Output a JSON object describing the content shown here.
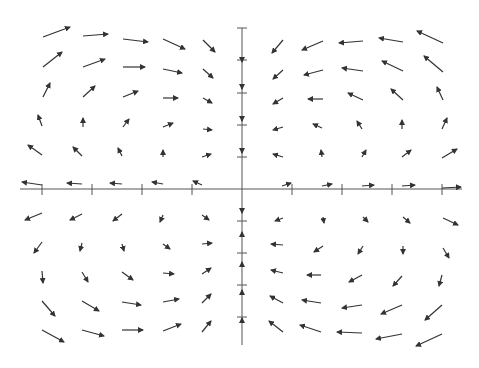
{
  "chart_data": {
    "type": "quiver",
    "title": "",
    "xlabel": "",
    "ylabel": "",
    "grid": false,
    "axes": {
      "origin_px": [
        242,
        189
      ],
      "x_axis_px": [
        20,
        462
      ],
      "y_axis_px": [
        28,
        345
      ],
      "x_ticks_px": [
        42,
        92,
        142,
        192,
        292,
        342,
        392,
        442
      ],
      "y_ticks_px": [
        28,
        60,
        93,
        125,
        157,
        221,
        253,
        285,
        317
      ],
      "tick_labels": []
    },
    "style": {
      "arrow_color": "#333333",
      "axis_color": "#555555"
    },
    "arrows": [
      [
        43,
        37,
        70,
        27
      ],
      [
        83,
        36,
        108,
        34
      ],
      [
        123,
        39,
        148,
        42
      ],
      [
        163,
        39,
        185,
        49
      ],
      [
        203,
        40,
        215,
        52
      ],
      [
        43,
        67,
        62,
        52
      ],
      [
        83,
        67,
        105,
        59
      ],
      [
        123,
        67,
        145,
        67
      ],
      [
        163,
        69,
        182,
        73
      ],
      [
        203,
        69,
        213,
        78
      ],
      [
        43,
        97,
        50,
        83
      ],
      [
        83,
        97,
        95,
        86
      ],
      [
        123,
        97,
        138,
        91
      ],
      [
        163,
        98,
        178,
        98
      ],
      [
        203,
        98,
        212,
        103
      ],
      [
        42,
        126,
        38,
        115
      ],
      [
        83,
        127,
        83,
        118
      ],
      [
        123,
        127,
        129,
        119
      ],
      [
        163,
        127,
        173,
        123
      ],
      [
        203,
        129,
        212,
        130
      ],
      [
        42,
        155,
        28,
        145
      ],
      [
        82,
        156,
        73,
        147
      ],
      [
        122,
        156,
        118,
        148
      ],
      [
        163,
        157,
        163,
        150
      ],
      [
        202,
        157,
        211,
        154
      ],
      [
        42,
        185,
        22,
        182
      ],
      [
        82,
        184,
        67,
        183
      ],
      [
        122,
        184,
        110,
        183
      ],
      [
        163,
        184,
        152,
        182
      ],
      [
        202,
        185,
        193,
        181
      ],
      [
        283,
        40,
        272,
        53
      ],
      [
        323,
        41,
        302,
        50
      ],
      [
        363,
        41,
        339,
        43
      ],
      [
        403,
        42,
        379,
        38
      ],
      [
        443,
        43,
        417,
        31
      ],
      [
        283,
        70,
        273,
        79
      ],
      [
        323,
        70,
        304,
        75
      ],
      [
        363,
        71,
        342,
        68
      ],
      [
        403,
        71,
        382,
        61
      ],
      [
        443,
        72,
        424,
        56
      ],
      [
        283,
        98,
        273,
        104
      ],
      [
        323,
        99,
        308,
        99
      ],
      [
        363,
        100,
        348,
        93
      ],
      [
        403,
        100,
        391,
        89
      ],
      [
        443,
        100,
        437,
        87
      ],
      [
        283,
        127,
        273,
        130
      ],
      [
        322,
        128,
        313,
        124
      ],
      [
        362,
        129,
        357,
        121
      ],
      [
        402,
        129,
        402,
        120
      ],
      [
        442,
        129,
        447,
        118
      ],
      [
        283,
        157,
        273,
        154
      ],
      [
        322,
        157,
        321,
        150
      ],
      [
        362,
        157,
        366,
        150
      ],
      [
        402,
        157,
        411,
        150
      ],
      [
        442,
        158,
        457,
        149
      ],
      [
        282,
        186,
        291,
        183
      ],
      [
        322,
        186,
        332,
        184
      ],
      [
        362,
        186,
        374,
        185
      ],
      [
        402,
        186,
        415,
        185
      ],
      [
        442,
        188,
        461,
        187
      ],
      [
        42,
        213,
        25,
        220
      ],
      [
        82,
        214,
        70,
        220
      ],
      [
        122,
        214,
        113,
        221
      ],
      [
        163,
        215,
        160,
        222
      ],
      [
        202,
        215,
        209,
        220
      ],
      [
        42,
        242,
        34,
        253
      ],
      [
        82,
        243,
        80,
        251
      ],
      [
        122,
        244,
        124,
        251
      ],
      [
        163,
        244,
        170,
        249
      ],
      [
        202,
        244,
        212,
        243
      ],
      [
        42,
        271,
        43,
        283
      ],
      [
        82,
        272,
        88,
        282
      ],
      [
        122,
        272,
        133,
        280
      ],
      [
        163,
        273,
        174,
        274
      ],
      [
        202,
        274,
        211,
        268
      ],
      [
        42,
        301,
        55,
        316
      ],
      [
        82,
        301,
        99,
        311
      ],
      [
        122,
        302,
        141,
        305
      ],
      [
        163,
        302,
        179,
        299
      ],
      [
        202,
        303,
        211,
        294
      ],
      [
        42,
        330,
        64,
        342
      ],
      [
        82,
        330,
        104,
        336
      ],
      [
        122,
        330,
        143,
        330
      ],
      [
        163,
        331,
        181,
        324
      ],
      [
        202,
        332,
        211,
        321
      ],
      [
        283,
        218,
        275,
        221
      ],
      [
        323,
        217,
        324,
        223
      ],
      [
        363,
        217,
        368,
        222
      ],
      [
        403,
        217,
        410,
        223
      ],
      [
        443,
        218,
        458,
        225
      ],
      [
        283,
        245,
        271,
        244
      ],
      [
        323,
        246,
        314,
        252
      ],
      [
        363,
        246,
        358,
        254
      ],
      [
        403,
        246,
        403,
        254
      ],
      [
        443,
        248,
        449,
        258
      ],
      [
        283,
        273,
        271,
        270
      ],
      [
        321,
        275,
        307,
        275
      ],
      [
        362,
        275,
        349,
        282
      ],
      [
        402,
        276,
        393,
        286
      ],
      [
        442,
        275,
        439,
        286
      ],
      [
        283,
        303,
        270,
        296
      ],
      [
        321,
        303,
        302,
        300
      ],
      [
        362,
        305,
        342,
        308
      ],
      [
        402,
        305,
        381,
        314
      ],
      [
        442,
        305,
        425,
        320
      ],
      [
        283,
        332,
        269,
        321
      ],
      [
        321,
        332,
        300,
        325
      ],
      [
        362,
        333,
        337,
        332
      ],
      [
        402,
        334,
        376,
        339
      ],
      [
        442,
        334,
        416,
        346
      ]
    ],
    "axis_arrows": [
      [
        242,
        57,
        242,
        62
      ],
      [
        242,
        84,
        242,
        89
      ],
      [
        242,
        116,
        242,
        121
      ],
      [
        242,
        148,
        242,
        153
      ],
      [
        242,
        208,
        242,
        213
      ],
      [
        242,
        237,
        242,
        232
      ],
      [
        242,
        266,
        242,
        262
      ],
      [
        242,
        294,
        242,
        290
      ],
      [
        242,
        322,
        242,
        318
      ]
    ]
  }
}
